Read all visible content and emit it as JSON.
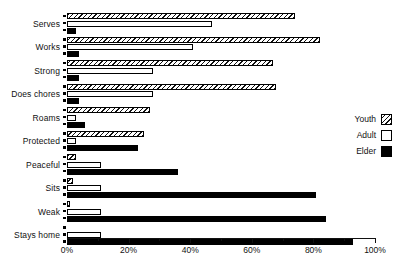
{
  "chart_data": {
    "type": "bar",
    "orientation": "horizontal",
    "title": "",
    "subtitle": "",
    "xlabel": "",
    "ylabel": "",
    "xlim": [
      0,
      100
    ],
    "xunit": "%",
    "grid": false,
    "legend_position": "right",
    "categories": [
      "Serves",
      "Works",
      "Strong",
      "Does chores",
      "Roams",
      "Protected",
      "Peaceful",
      "Sits",
      "Weak",
      "Stays home"
    ],
    "xticks": [
      0,
      20,
      40,
      60,
      80,
      100
    ],
    "xtick_labels": [
      "0%",
      "20%",
      "40%",
      "60%",
      "80%",
      "100%"
    ],
    "xminor_ticks": [
      10,
      30,
      50,
      70,
      90
    ],
    "series": [
      {
        "name": "Youth",
        "fill": "hatched",
        "color": "#ffffff",
        "values": [
          74,
          82,
          67,
          68,
          27,
          25,
          3,
          2,
          1,
          0
        ]
      },
      {
        "name": "Adult",
        "fill": "empty",
        "color": "#ffffff",
        "values": [
          47,
          41,
          28,
          28,
          3,
          3,
          11,
          11,
          11,
          11
        ]
      },
      {
        "name": "Elder",
        "fill": "solid",
        "color": "#000000",
        "values": [
          3,
          4,
          4,
          4,
          6,
          23,
          36,
          81,
          84,
          93
        ]
      }
    ]
  },
  "legend": {
    "items": [
      {
        "label": "Youth",
        "swatch": "hatched-swatch"
      },
      {
        "label": "Adult",
        "swatch": "empty-swatch"
      },
      {
        "label": "Elder",
        "swatch": "solid-swatch"
      }
    ]
  }
}
